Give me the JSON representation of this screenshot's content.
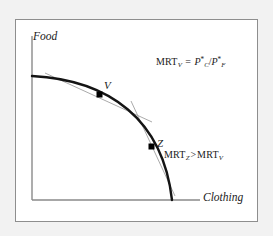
{
  "figure": {
    "type": "production-possibilities-frontier",
    "background_color": "#f2f2f2",
    "panel_color": "#ffffff",
    "frame_color": "#8e8e8e",
    "curve_color": "#141414",
    "tangent_color": "#9a9a9a",
    "axis_color": "#8a8a8a",
    "marker_color": "#000000"
  },
  "axes": {
    "y_label": "Food",
    "x_label": "Clothing",
    "origin": {
      "x": 32,
      "y": 200
    },
    "y_top": {
      "x": 32,
      "y": 36
    },
    "x_right": {
      "x": 200,
      "y": 200
    }
  },
  "curve": {
    "name": "production-possibilities-frontier",
    "start": {
      "x": 32,
      "y": 76
    },
    "end": {
      "x": 172,
      "y": 200
    },
    "control_1": {
      "x": 110,
      "y": 80
    },
    "control_2": {
      "x": 163,
      "y": 120
    }
  },
  "points": [
    {
      "id": "V",
      "label": "V",
      "marker": {
        "x": 100,
        "y": 95
      },
      "tangent": {
        "x1": 45,
        "y1": 73,
        "x2": 152,
        "y2": 122
      }
    },
    {
      "id": "Z",
      "label": "Z",
      "marker": {
        "x": 152,
        "y": 147
      },
      "tangent": {
        "x1": 131,
        "y1": 101,
        "x2": 175,
        "y2": 196
      }
    }
  ],
  "annotations": {
    "mrt_v": {
      "name": "mrt-v-formula",
      "mrt": "MRT",
      "mrt_sub": "V",
      "equals": "=",
      "numerator_base": "P",
      "numerator_star": "*",
      "numerator_sub": "C",
      "divider": "/",
      "denominator_base": "P",
      "denominator_star": "*",
      "denominator_sub": "F",
      "plain_text": "MRTV = P*C/P*F"
    },
    "mrt_compare": {
      "name": "mrt-comparison-formula",
      "left_mrt": "MRT",
      "left_sub": "Z",
      "operator": ">",
      "right_mrt": "MRT",
      "right_sub": "V",
      "plain_text": "MRTZ > MRTV"
    }
  }
}
